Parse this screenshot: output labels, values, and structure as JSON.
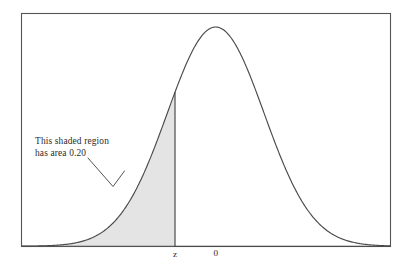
{
  "figure": {
    "annotation": {
      "line1": "This shaded region",
      "line2": "has area 0.20"
    },
    "axis_labels": {
      "z": "z",
      "zero": "0"
    }
  },
  "chart_data": {
    "type": "area",
    "title": "",
    "subtitle": "",
    "xlabel": "",
    "ylabel": "",
    "distribution": "standard normal",
    "mean": 0,
    "sd": 1,
    "shaded_area": 0.2,
    "shaded_region": "left tail, from -infinity to z",
    "cutoff_label": "z",
    "cutoff_value": -0.84,
    "center_label": "0",
    "center_value": 0,
    "tick_labels": [
      "z",
      "0"
    ],
    "tick_values": [
      -0.84,
      0
    ],
    "xlim": [
      -4.0,
      3.6
    ],
    "ylim": [
      0,
      0.43
    ],
    "grid": false,
    "legend": false,
    "legend_position": "none",
    "annotations": [
      {
        "text": "This shaded region has area 0.20",
        "points_to": "shaded left tail region",
        "leader_line": true
      }
    ],
    "curve_x": [
      -4.0,
      -3.7,
      -3.4,
      -3.1,
      -2.8,
      -2.5,
      -2.2,
      -1.9,
      -1.6,
      -1.3,
      -1.0,
      -0.84,
      -0.7,
      -0.4,
      -0.1,
      0.0,
      0.2,
      0.5,
      0.8,
      1.1,
      1.4,
      1.7,
      2.0,
      2.3,
      2.6,
      2.9,
      3.2,
      3.6
    ],
    "curve_y": [
      0.0001,
      0.0004,
      0.0012,
      0.0033,
      0.0079,
      0.0175,
      0.0355,
      0.0656,
      0.1109,
      0.1714,
      0.242,
      0.2803,
      0.3123,
      0.3683,
      0.397,
      0.3989,
      0.391,
      0.3521,
      0.2897,
      0.2179,
      0.1497,
      0.094,
      0.054,
      0.0283,
      0.0136,
      0.006,
      0.0024,
      0.0006
    ],
    "colors": {
      "curve_stroke": "#4a4a4a",
      "shade_fill": "#e4e4e4",
      "frame_stroke": "#555555",
      "text": "#2b2b2b",
      "background": "#ffffff"
    }
  }
}
